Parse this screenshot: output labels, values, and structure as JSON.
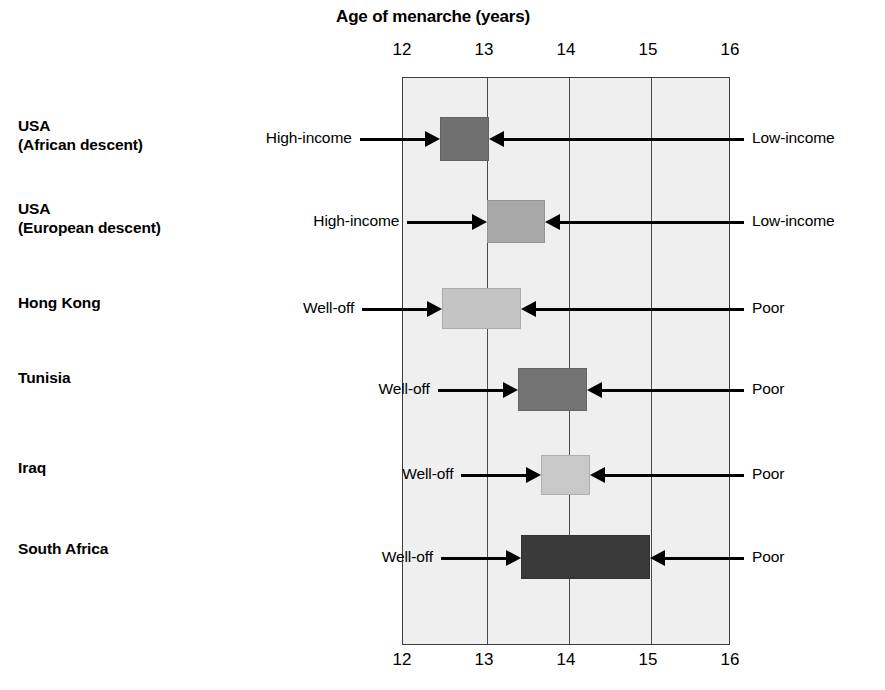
{
  "chart_data": {
    "type": "bar",
    "orientation": "horizontal",
    "title": "Age of menarche (years)",
    "xlabel": "Age of menarche (years)",
    "ylabel": "",
    "xlim": [
      12,
      16
    ],
    "xticks": [
      12,
      13,
      14,
      15,
      16
    ],
    "xtick_labels": [
      "12",
      "13",
      "14",
      "15",
      "16"
    ],
    "xticks_top": [
      "12",
      "13",
      "14",
      "15",
      "16"
    ],
    "xticks_bottom": [
      "12",
      "13",
      "14",
      "15",
      "16"
    ],
    "grid": true,
    "grid_axis": "x",
    "legend": "none",
    "plot_background": "#efefef",
    "axis_color": "#3d3d3d",
    "categories": [
      "USA\n(African descent)",
      "USA\n(European descent)",
      "Hong Kong",
      "Tunisia",
      "Iraq",
      "South Africa"
    ],
    "bars": [
      {
        "category": "USA\n(African descent)",
        "category_plain": "USA (African descent)",
        "start": 12.46,
        "end": 13.06,
        "color": "#707070",
        "left_label": "High-income",
        "right_label": "Low-income"
      },
      {
        "category": "USA\n(European descent)",
        "category_plain": "USA (European descent)",
        "start": 13.04,
        "end": 13.74,
        "color": "#a8a8a8",
        "left_label": "High-income",
        "right_label": "Low-income"
      },
      {
        "category": "Hong Kong",
        "category_plain": "Hong Kong",
        "start": 12.49,
        "end": 13.45,
        "color": "#c4c4c4",
        "left_label": "Well-off",
        "right_label": "Poor"
      },
      {
        "category": "Tunisia",
        "category_plain": "Tunisia",
        "start": 13.41,
        "end": 14.26,
        "color": "#737373",
        "left_label": "Well-off",
        "right_label": "Poor"
      },
      {
        "category": "Iraq",
        "category_plain": "Iraq",
        "start": 13.7,
        "end": 14.29,
        "color": "#c8c8c8",
        "left_label": "Well-off",
        "right_label": "Poor"
      },
      {
        "category": "South Africa",
        "category_plain": "South Africa",
        "start": 13.45,
        "end": 15.02,
        "color": "#3a3a3a",
        "left_label": "Well-off",
        "right_label": "Poor"
      }
    ]
  },
  "geometry": {
    "plot_left": 402,
    "plot_right": 730,
    "plot_top": 77,
    "plot_bottom": 645,
    "value_min": 12,
    "value_max": 16,
    "rows": [
      {
        "label_top": 116,
        "bar_top": 117,
        "bar_height": 44,
        "axis_y": 139
      },
      {
        "label_top": 199,
        "bar_top": 200,
        "bar_height": 43,
        "axis_y": 222
      },
      {
        "label_top": 293,
        "bar_top": 288,
        "bar_height": 41,
        "axis_y": 309
      },
      {
        "label_top": 368,
        "bar_top": 368,
        "bar_height": 43,
        "axis_y": 390
      },
      {
        "label_top": 458,
        "bar_top": 455,
        "bar_height": 40,
        "axis_y": 475
      },
      {
        "label_top": 539,
        "bar_top": 535,
        "bar_height": 44,
        "axis_y": 558
      }
    ],
    "left_label_anchor_x": 388,
    "right_label_anchor_x": 752
  }
}
